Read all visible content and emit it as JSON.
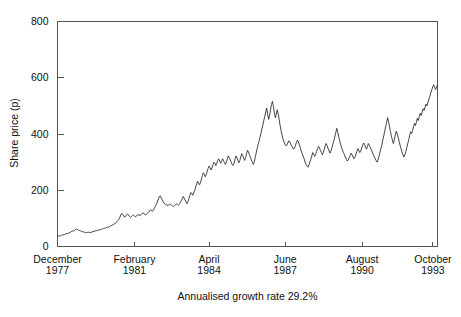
{
  "chart_data": {
    "type": "line",
    "title": "",
    "subtitle": "",
    "xlabel": "",
    "ylabel": "Share price (p)",
    "caption": "Annualised growth rate 29.2%",
    "grid": false,
    "legend": null,
    "ylim": [
      0,
      800
    ],
    "yticks": [
      0,
      200,
      400,
      600,
      800
    ],
    "ytick_labels": [
      "0",
      "200",
      "400",
      "600",
      "800"
    ],
    "xtick_labels": [
      {
        "month": "December",
        "year": "1977"
      },
      {
        "month": "February",
        "year": "1981"
      },
      {
        "month": "April",
        "year": "1984"
      },
      {
        "month": "June",
        "year": "1987"
      },
      {
        "month": "August",
        "year": "1990"
      },
      {
        "month": "October",
        "year": "1993"
      }
    ],
    "xtick_positions": [
      0,
      0.2024,
      0.3988,
      0.5992,
      0.8016,
      0.988
    ],
    "x_start_label": "December 1977",
    "x_end_label": "October 1993",
    "series": [
      {
        "name": "Share price",
        "color": "#222222",
        "values": [
          36,
          37,
          38,
          38,
          40,
          41,
          41,
          42,
          44,
          46,
          45,
          47,
          48,
          50,
          52,
          54,
          56,
          55,
          58,
          61,
          62,
          60,
          58,
          57,
          55,
          54,
          53,
          52,
          51,
          50,
          49,
          50,
          51,
          50,
          49,
          50,
          52,
          53,
          54,
          56,
          55,
          57,
          58,
          58,
          60,
          59,
          61,
          63,
          64,
          66,
          65,
          67,
          69,
          68,
          70,
          72,
          74,
          76,
          78,
          80,
          82,
          85,
          88,
          92,
          97,
          104,
          112,
          118,
          114,
          109,
          104,
          108,
          113,
          116,
          112,
          107,
          104,
          106,
          110,
          112,
          109,
          106,
          108,
          111,
          113,
          112,
          110,
          113,
          117,
          119,
          117,
          114,
          113,
          116,
          119,
          122,
          126,
          131,
          128,
          125,
          130,
          136,
          142,
          150,
          158,
          168,
          176,
          180,
          174,
          167,
          160,
          155,
          152,
          149,
          147,
          146,
          148,
          151,
          149,
          146,
          144,
          143,
          145,
          148,
          152,
          150,
          147,
          150,
          156,
          163,
          170,
          178,
          172,
          165,
          158,
          152,
          160,
          170,
          182,
          192,
          188,
          182,
          190,
          200,
          212,
          222,
          232,
          226,
          219,
          228,
          240,
          252,
          262,
          256,
          248,
          256,
          268,
          278,
          286,
          280,
          272,
          280,
          290,
          300,
          296,
          288,
          296,
          306,
          312,
          304,
          296,
          302,
          312,
          306,
          298,
          292,
          300,
          312,
          322,
          316,
          308,
          300,
          292,
          288,
          296,
          310,
          322,
          316,
          306,
          298,
          306,
          318,
          330,
          324,
          314,
          306,
          316,
          330,
          342,
          336,
          326,
          318,
          308,
          300,
          292,
          300,
          316,
          332,
          348,
          362,
          374,
          388,
          402,
          418,
          432,
          448,
          462,
          478,
          492,
          470,
          452,
          468,
          486,
          505,
          516,
          498,
          476,
          458,
          470,
          486,
          472,
          452,
          430,
          412,
          396,
          382,
          372,
          364,
          358,
          360,
          368,
          376,
          372,
          364,
          358,
          352,
          346,
          350,
          360,
          370,
          378,
          372,
          362,
          352,
          340,
          330,
          322,
          312,
          300,
          292,
          286,
          282,
          290,
          300,
          310,
          322,
          334,
          328,
          320,
          328,
          338,
          348,
          356,
          350,
          342,
          334,
          326,
          334,
          346,
          358,
          366,
          358,
          348,
          340,
          332,
          340,
          352,
          364,
          376,
          390,
          404,
          420,
          408,
          392,
          376,
          364,
          352,
          342,
          334,
          326,
          318,
          310,
          304,
          308,
          316,
          324,
          332,
          326,
          318,
          312,
          318,
          328,
          338,
          348,
          342,
          334,
          340,
          350,
          360,
          368,
          362,
          354,
          346,
          356,
          366,
          360,
          352,
          344,
          336,
          328,
          320,
          312,
          306,
          300,
          308,
          320,
          334,
          348,
          362,
          378,
          394,
          410,
          426,
          442,
          458,
          444,
          426,
          408,
          392,
          378,
          366,
          380,
          396,
          410,
          402,
          388,
          374,
          360,
          348,
          336,
          326,
          318,
          326,
          338,
          352,
          366,
          380,
          394,
          408,
          402,
          412,
          426,
          438,
          430,
          442,
          456,
          448,
          462,
          474,
          466,
          478,
          490,
          484,
          496,
          506,
          500,
          512,
          524,
          534,
          546,
          556,
          568,
          575,
          566,
          558,
          568,
          574
        ]
      }
    ]
  },
  "axes": {
    "y_axis_title": "Share price (p)"
  }
}
